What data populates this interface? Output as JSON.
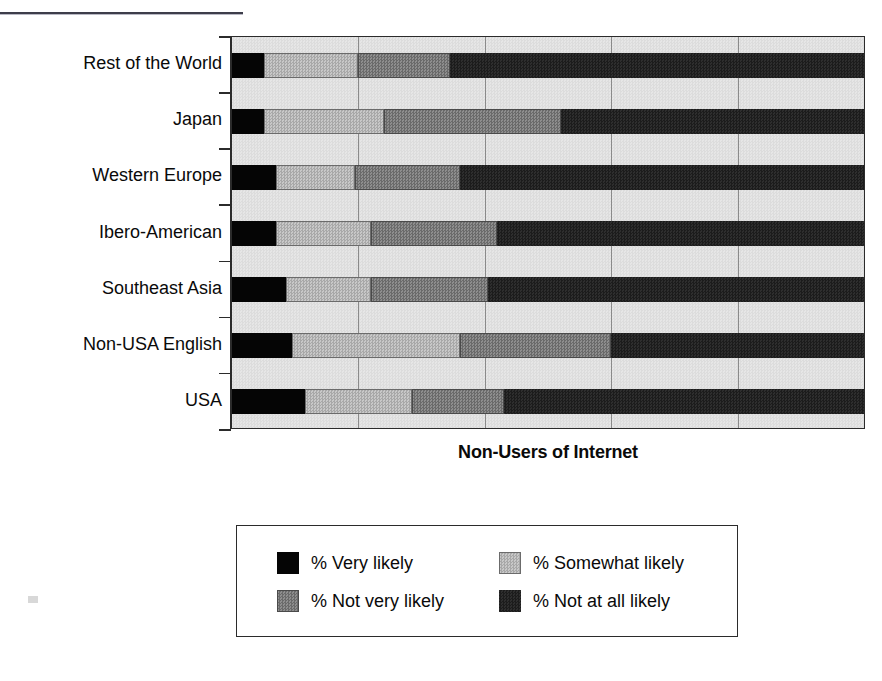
{
  "chart_data": {
    "type": "bar",
    "orientation": "horizontal",
    "stacked": true,
    "normalized_percent": true,
    "title": "",
    "xlabel": "Non-Users of Internet",
    "ylabel": "",
    "xlim": [
      0,
      100
    ],
    "grid": true,
    "gridlines_x": [
      20,
      40,
      60,
      80
    ],
    "legend_position": "bottom",
    "categories": [
      "Rest of the World",
      "Japan",
      "Western Europe",
      "Ibero-American",
      "Southeast Asia",
      "Non-USA English",
      "USA"
    ],
    "series": [
      {
        "name": "% Very likely",
        "color": "#050505",
        "values": [
          5,
          5,
          7,
          7,
          8.5,
          9.5,
          11.5
        ]
      },
      {
        "name": "% Somewhat likely",
        "color": "#b8b8b8",
        "values": [
          15,
          19,
          12.5,
          15,
          13.5,
          26.5,
          17
        ]
      },
      {
        "name": "% Not very likely",
        "color": "#7c7c7c",
        "values": [
          14.5,
          28,
          16.5,
          20,
          18.5,
          24,
          14.5
        ]
      },
      {
        "name": "% Not at all likely",
        "color": "#262626",
        "values": [
          65.5,
          48,
          64,
          58,
          59.5,
          40,
          57
        ]
      }
    ]
  },
  "axis": {
    "x_title": "Non-Users of Internet"
  },
  "legend": {
    "items": [
      {
        "label": "% Very likely",
        "swatch": "very"
      },
      {
        "label": "% Somewhat likely",
        "swatch": "somewhat"
      },
      {
        "label": "% Not very likely",
        "swatch": "notvery"
      },
      {
        "label": "% Not at all likely",
        "swatch": "notatall"
      }
    ]
  }
}
